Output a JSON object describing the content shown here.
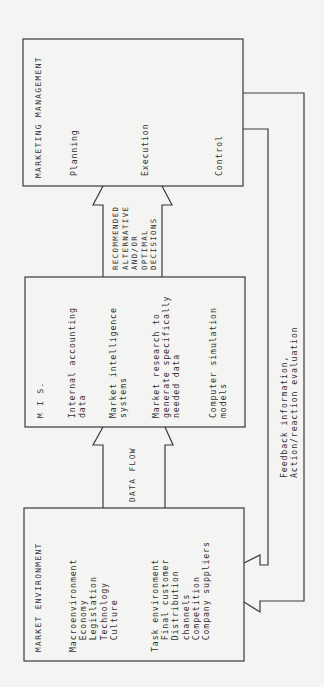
{
  "marketing_management": {
    "title": "MARKETING MANAGEMENT",
    "items": [
      "Planning",
      "Execution",
      "Control"
    ]
  },
  "mis": {
    "title": "M I S.",
    "items": [
      "Internal accounting\ndata",
      "Market intelligence\nsystems",
      "Market research to\ngenerate specifically\nneeded data",
      "Computer simulation\nmodels"
    ]
  },
  "market_environment": {
    "title": "MARKET ENVIRONMENT",
    "macro": "Macroenvironment\n  Economy\n  Legislation\n  Technology\n  Culture",
    "task": "Task environment\n  Final customer\n  Distribution\n  channels\n  Competition\n  Company suppliers"
  },
  "arrows": {
    "data_flow": "DATA FLOW",
    "decisions": "RECOMMENDED\nALTERNATIVE\nAND/OR\nOPTIMAL\nDECISIONS",
    "feedback": "Feedback information,\nAction/reaction evaluation"
  },
  "colors": {
    "line": "#3a3a3a",
    "background": "#f4f4f2"
  }
}
